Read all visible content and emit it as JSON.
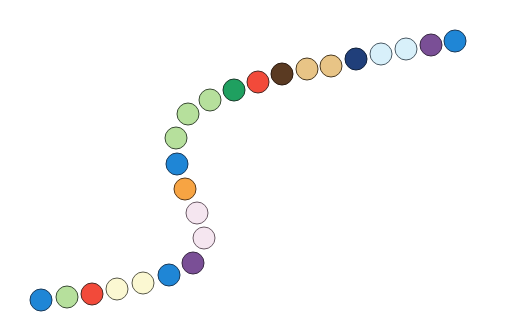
{
  "scene": {
    "description": "Chain of colored beads forming an S-shaped curve",
    "bead_count": 24,
    "bead_radius": 11.5,
    "beads": [
      {
        "x": 41,
        "y": 300,
        "color": "#1f86d6",
        "border": "#1a3a5a"
      },
      {
        "x": 67,
        "y": 297,
        "color": "#b6e09c",
        "border": "#3a4a35"
      },
      {
        "x": 92,
        "y": 294,
        "color": "#f24a3a",
        "border": "#4a2a25"
      },
      {
        "x": 117,
        "y": 289,
        "color": "#fbf8d2",
        "border": "#5a5a4a"
      },
      {
        "x": 143,
        "y": 283,
        "color": "#fbf8d2",
        "border": "#5a5a4a"
      },
      {
        "x": 169,
        "y": 275,
        "color": "#1f86d6",
        "border": "#1a3a5a"
      },
      {
        "x": 193,
        "y": 263,
        "color": "#7a4f96",
        "border": "#3a2a45"
      },
      {
        "x": 204,
        "y": 238,
        "color": "#f5e6f0",
        "border": "#6a5a65"
      },
      {
        "x": 197,
        "y": 213,
        "color": "#f5e6f0",
        "border": "#6a5a65"
      },
      {
        "x": 185,
        "y": 189,
        "color": "#f7a443",
        "border": "#5a3a1a"
      },
      {
        "x": 177,
        "y": 164,
        "color": "#1f86d6",
        "border": "#1a3a5a"
      },
      {
        "x": 176,
        "y": 138,
        "color": "#b6e09c",
        "border": "#3a4a35"
      },
      {
        "x": 188,
        "y": 114,
        "color": "#b6e09c",
        "border": "#3a4a35"
      },
      {
        "x": 210,
        "y": 100,
        "color": "#b6e09c",
        "border": "#3a4a35"
      },
      {
        "x": 234,
        "y": 90,
        "color": "#1fa060",
        "border": "#1a3a2a"
      },
      {
        "x": 258,
        "y": 82,
        "color": "#f24a3a",
        "border": "#4a2a25"
      },
      {
        "x": 282,
        "y": 74,
        "color": "#5a3a22",
        "border": "#2a1a10"
      },
      {
        "x": 307,
        "y": 69,
        "color": "#e8c486",
        "border": "#4a3a22"
      },
      {
        "x": 331,
        "y": 66,
        "color": "#e8c486",
        "border": "#4a3a22"
      },
      {
        "x": 356,
        "y": 59,
        "color": "#203f7a",
        "border": "#10203a"
      },
      {
        "x": 381,
        "y": 54,
        "color": "#d8f0fa",
        "border": "#4a5a65"
      },
      {
        "x": 406,
        "y": 49,
        "color": "#d8f0fa",
        "border": "#4a5a65"
      },
      {
        "x": 431,
        "y": 45,
        "color": "#7a4f96",
        "border": "#3a2a45"
      },
      {
        "x": 455,
        "y": 41,
        "color": "#1f86d6",
        "border": "#1a3a5a"
      }
    ]
  }
}
